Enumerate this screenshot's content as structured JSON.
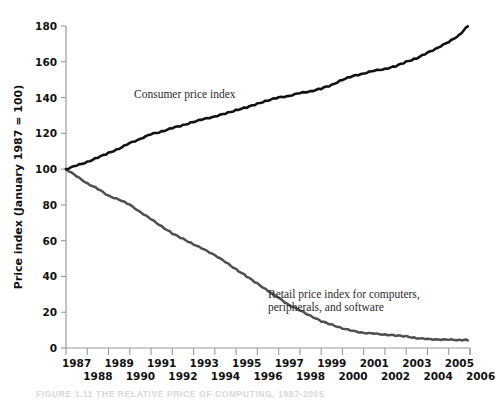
{
  "figure": {
    "caption": "FIGURE 1.11   THE RELATIVE PRICE OF COMPUTING, 1987-2005"
  },
  "chart_data": {
    "type": "line",
    "title": "",
    "xlabel": "",
    "ylabel": "Price index (January 1987 = 100)",
    "ylim": [
      0,
      180
    ],
    "xlim": [
      1987,
      2006
    ],
    "grid": false,
    "legend_position": "inline-annotation",
    "yticks": [
      0,
      20,
      40,
      60,
      80,
      100,
      120,
      140,
      160,
      180
    ],
    "ytick_labels": [
      "0",
      "20",
      "40",
      "60",
      "80",
      "100",
      "120",
      "140",
      "160",
      "180"
    ],
    "xticks": [
      1987,
      1988,
      1989,
      1990,
      1991,
      1992,
      1993,
      1994,
      1995,
      1996,
      1997,
      1998,
      1999,
      2000,
      2001,
      2002,
      2003,
      2004,
      2005,
      2006
    ],
    "xtick_labels_top": [
      "1987",
      "1989",
      "1991",
      "1993",
      "1995",
      "1997",
      "1999",
      "2001",
      "2003",
      "2005"
    ],
    "xtick_labels_bottom": [
      "1988",
      "1990",
      "1992",
      "1994",
      "1996",
      "1998",
      "2000",
      "2002",
      "2004",
      "2006"
    ],
    "series": [
      {
        "name": "Consumer price index",
        "color": "#111111",
        "label_text": "Consumer price index",
        "x": [
          1987,
          1987.5,
          1988,
          1988.5,
          1989,
          1989.5,
          1990,
          1990.5,
          1991,
          1991.5,
          1992,
          1992.5,
          1993,
          1993.5,
          1994,
          1994.5,
          1995,
          1995.5,
          1996,
          1996.5,
          1997,
          1997.5,
          1998,
          1998.5,
          1999,
          1999.5,
          2000,
          2000.5,
          2001,
          2001.5,
          2002,
          2002.5,
          2003,
          2003.5,
          2004,
          2004.5,
          2005,
          2005.5,
          2005.9
        ],
        "values": [
          100,
          102,
          104,
          106.5,
          109,
          111.5,
          114.5,
          117,
          119.5,
          121,
          123,
          124.5,
          126.5,
          128,
          129.5,
          131,
          133,
          134.5,
          136.5,
          138.5,
          140,
          141,
          142.5,
          143.5,
          145,
          147,
          150,
          152,
          153.5,
          155,
          156,
          157.5,
          160,
          162,
          165,
          168,
          171,
          175,
          180
        ]
      },
      {
        "name": "Retail price index for computers, peripherals, and software",
        "color": "#4f4f4f",
        "label_text": "Retail price index for computers, peripherals, and software",
        "x": [
          1987,
          1987.5,
          1988,
          1988.5,
          1989,
          1989.5,
          1990,
          1990.5,
          1991,
          1991.5,
          1992,
          1992.5,
          1993,
          1993.5,
          1994,
          1994.5,
          1995,
          1995.5,
          1996,
          1996.5,
          1997,
          1997.5,
          1998,
          1998.5,
          1999,
          1999.5,
          2000,
          2000.5,
          2001,
          2001.5,
          2002,
          2002.5,
          2003,
          2003.5,
          2004,
          2004.5,
          2005,
          2005.5,
          2005.9
        ],
        "values": [
          100,
          96,
          92,
          89,
          85,
          83,
          80,
          76,
          72,
          68,
          64,
          61,
          58,
          55,
          52,
          48,
          44,
          40,
          36,
          32,
          28,
          24,
          21,
          18,
          15,
          13,
          11,
          9.5,
          8.5,
          8,
          7.5,
          7,
          6.5,
          5.5,
          5,
          4.8,
          4.6,
          4.5,
          4.5
        ]
      }
    ],
    "annotations": [
      {
        "text": "Consumer price index",
        "x": 1990.2,
        "y": 140
      },
      {
        "text": "Retail price index for computers,",
        "x": 1996.6,
        "y": 36
      },
      {
        "text": "peripherals, and software",
        "x": 1996.6,
        "y": 29
      }
    ]
  }
}
